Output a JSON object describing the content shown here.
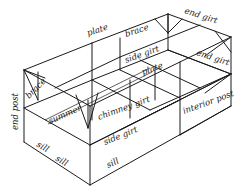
{
  "diagram": {
    "labels": {
      "plate_top": "plate",
      "brace_top": "brace",
      "end_girt_top": "end girt",
      "side_girt_upper": "side girt",
      "end_girt_right": "end girt",
      "plate_mid": "plate",
      "brace_left": "brace",
      "end_post": "end post",
      "summer": "summer",
      "chimney_girt": "chimney girt",
      "interior_post": "interior post",
      "sill_left": "sill",
      "sill_front": "sill",
      "side_girt_front": "side girt",
      "sill_right": "sill"
    },
    "colors": {
      "line": "#1a1a1a",
      "background": "#ffffff"
    }
  }
}
